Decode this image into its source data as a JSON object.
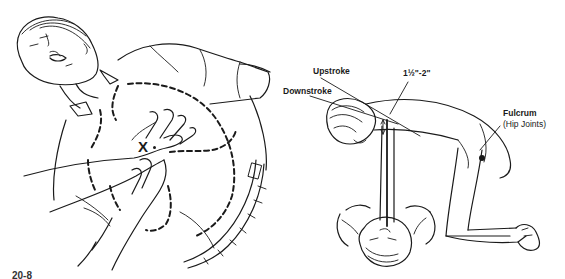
{
  "figure_left": {
    "landmark_label": "X",
    "description": "Hand placement on lower sternum of supine victim; dashed outline of rib cage"
  },
  "figure_right": {
    "labels": {
      "upstroke": "Upstroke",
      "downstroke": "Downstroke",
      "depth": "1½\"-2\"",
      "fulcrum": "Fulcrum",
      "fulcrum_note": "(Hip Joints)"
    },
    "description": "Kneeling rescuer performing chest compressions, arms straight, hips as fulcrum"
  },
  "caption": "20-8"
}
